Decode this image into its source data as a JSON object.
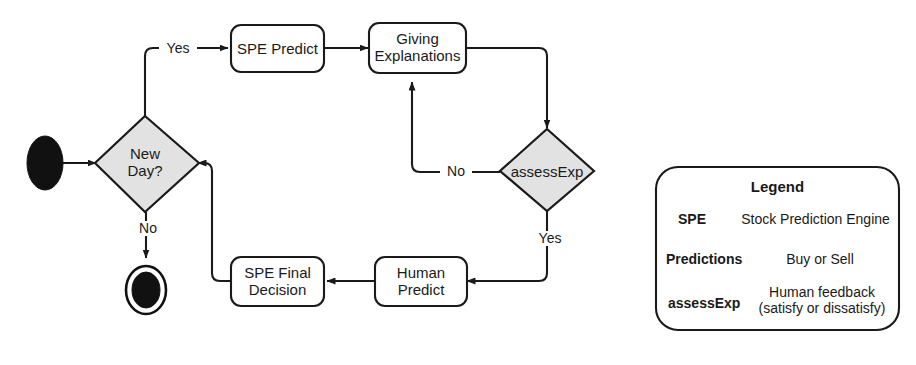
{
  "diagram": {
    "type": "uml-activity-diagram",
    "nodes": {
      "start": {
        "kind": "initial-node",
        "label": ""
      },
      "new_day": {
        "kind": "decision",
        "label_line1": "New",
        "label_line2": "Day?"
      },
      "spe_predict": {
        "kind": "action",
        "label": "SPE Predict"
      },
      "giving_explanations": {
        "kind": "action",
        "label_line1": "Giving",
        "label_line2": "Explanations"
      },
      "assess_exp": {
        "kind": "decision",
        "label": "assessExp"
      },
      "human_predict": {
        "kind": "action",
        "label_line1": "Human",
        "label_line2": "Predict"
      },
      "spe_final_decision": {
        "kind": "action",
        "label_line1": "SPE Final",
        "label_line2": "Decision"
      },
      "end": {
        "kind": "final-node",
        "label": ""
      }
    },
    "edge_labels": {
      "new_day_yes": "Yes",
      "new_day_no": "No",
      "assess_exp_no": "No",
      "assess_exp_yes": "Yes"
    },
    "colors": {
      "stroke": "#1a1a1a",
      "decision_fill": "#e2e2e2",
      "action_fill": "#ffffff",
      "node_fill": "#111111",
      "background": "#ffffff"
    }
  },
  "legend": {
    "title": "Legend",
    "entries": [
      {
        "term": "SPE",
        "definition_line1": "Stock Prediction Engine",
        "definition_line2": ""
      },
      {
        "term": "Predictions",
        "definition_line1": "Buy or Sell",
        "definition_line2": ""
      },
      {
        "term": "assessExp",
        "definition_line1": "Human feedback",
        "definition_line2": "(satisfy or dissatisfy)"
      }
    ]
  }
}
